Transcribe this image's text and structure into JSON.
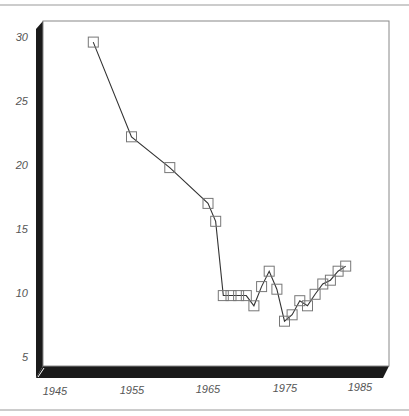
{
  "chart_data": {
    "type": "line",
    "title": "",
    "xlabel": "",
    "ylabel": "",
    "style": "3d-frame with square markers",
    "xlim": [
      1945,
      1985
    ],
    "ylim": [
      5,
      30
    ],
    "x_ticks": [
      "1945",
      "1955",
      "1965",
      "1975",
      "1985"
    ],
    "y_ticks": [
      "5",
      "10",
      "15",
      "20",
      "25",
      "30"
    ],
    "grid": false,
    "legend": null,
    "series": [
      {
        "name": "series-1",
        "marker": "open-square",
        "points": [
          {
            "x": 1950,
            "y": 29.6
          },
          {
            "x": 1955,
            "y": 22.2
          },
          {
            "x": 1960,
            "y": 19.8
          },
          {
            "x": 1965,
            "y": 17.0
          },
          {
            "x": 1966,
            "y": 15.6
          },
          {
            "x": 1967,
            "y": 9.8
          },
          {
            "x": 1968,
            "y": 9.8
          },
          {
            "x": 1969,
            "y": 9.8
          },
          {
            "x": 1970,
            "y": 9.8
          },
          {
            "x": 1971,
            "y": 9.0
          },
          {
            "x": 1972,
            "y": 10.5
          },
          {
            "x": 1973,
            "y": 11.7
          },
          {
            "x": 1974,
            "y": 10.3
          },
          {
            "x": 1975,
            "y": 7.8
          },
          {
            "x": 1976,
            "y": 8.3
          },
          {
            "x": 1977,
            "y": 9.4
          },
          {
            "x": 1978,
            "y": 9.0
          },
          {
            "x": 1979,
            "y": 9.9
          },
          {
            "x": 1980,
            "y": 10.7
          },
          {
            "x": 1981,
            "y": 11.0
          },
          {
            "x": 1982,
            "y": 11.7
          },
          {
            "x": 1983,
            "y": 12.1
          }
        ]
      }
    ]
  },
  "colors": {
    "frame": "#888888",
    "wall": "#1a1a1a",
    "line": "#333333",
    "marker": "#777777",
    "tick_text": "#555555"
  }
}
